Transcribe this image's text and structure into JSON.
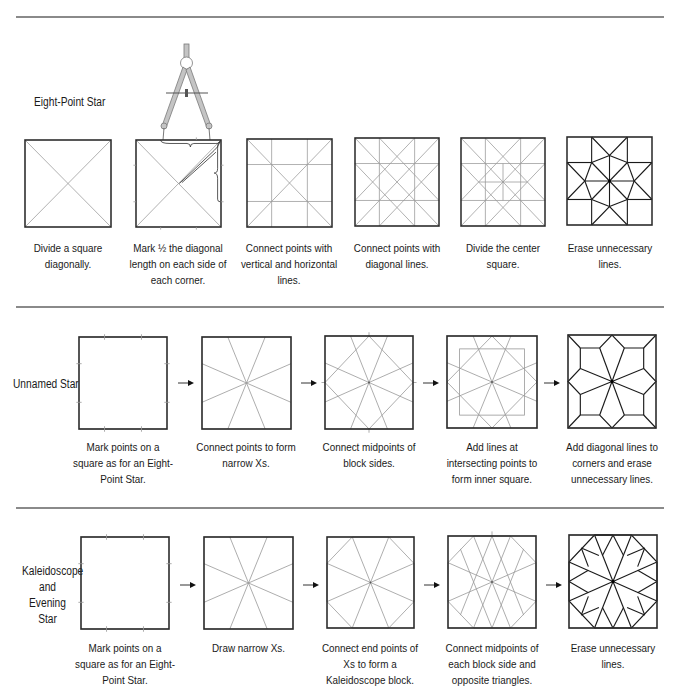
{
  "colors": {
    "rule": "#8a8a8a",
    "outline": "#2a2a2a",
    "guide": "#9a9a9a",
    "final": "#1a1a1a",
    "compass": "#b8b8b8"
  },
  "rows": [
    {
      "title": "Eight-Point Star",
      "steps": [
        {
          "caption": "Divide a square diagonally.",
          "icon": "square-diagonals-diagram"
        },
        {
          "caption": "Mark ½ the diagonal length on each side of each corner.",
          "icon": "compass-marking-diagram"
        },
        {
          "caption": "Connect points with vertical and horizontal lines.",
          "icon": "grid-lines-diagram"
        },
        {
          "caption": "Connect points with diagonal lines.",
          "icon": "diagonal-grid-diagram"
        },
        {
          "caption": "Divide the center square.",
          "icon": "divided-center-diagram"
        },
        {
          "caption": "Erase unnecessary lines.",
          "icon": "eight-point-star-diagram"
        }
      ]
    },
    {
      "title": "Unnamed Star",
      "steps": [
        {
          "caption": "Mark points on a square as for an Eight-Point Star.",
          "icon": "marked-square-diagram"
        },
        {
          "caption": "Connect points to form narrow Xs.",
          "icon": "narrow-xs-diagram"
        },
        {
          "caption": "Connect midpoints of block sides.",
          "icon": "midpoints-diagram"
        },
        {
          "caption": "Add lines at intersecting points to form inner square.",
          "icon": "inner-square-diagram"
        },
        {
          "caption": "Add diagonal lines to corners and erase unnecessary lines.",
          "icon": "unnamed-star-diagram"
        }
      ]
    },
    {
      "title": "Kaleidoscope and Evening Star",
      "steps": [
        {
          "caption": "Mark points on a square as for an Eight-Point Star.",
          "icon": "marked-square-diagram"
        },
        {
          "caption": "Draw narrow Xs.",
          "icon": "narrow-xs-diagram"
        },
        {
          "caption": "Connect end points of Xs to form a Kaleidoscope block.",
          "icon": "kaleidoscope-diagram"
        },
        {
          "caption": "Connect midpoints of each block side and opposite triangles.",
          "icon": "opposite-triangles-diagram"
        },
        {
          "caption": "Erase unnecessary lines.",
          "icon": "evening-star-diagram"
        }
      ]
    }
  ]
}
